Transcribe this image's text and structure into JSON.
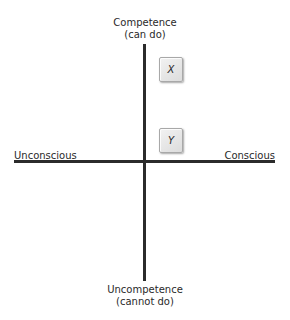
{
  "axes": {
    "top": {
      "line1": "Competence",
      "line2": "(can do)"
    },
    "bottom": {
      "line1": "Uncompetence",
      "line2": "(cannot do)"
    },
    "left": "Unconscious",
    "right": "Conscious"
  },
  "points": [
    {
      "id": "x",
      "label": "X"
    },
    {
      "id": "y",
      "label": "Y"
    }
  ],
  "colors": {
    "axis": "#2b2b2b",
    "text": "#2a2a2a",
    "box_fill": "#e6e6e6",
    "box_border": "#a8a8a8"
  }
}
